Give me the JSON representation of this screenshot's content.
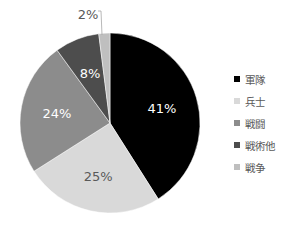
{
  "chart_data": {
    "type": "pie",
    "title": "",
    "categories": [
      "軍隊",
      "兵士",
      "戦闘",
      "戦術他",
      "戦争"
    ],
    "values": [
      41,
      25,
      24,
      8,
      2
    ],
    "labels": [
      "41%",
      "25%",
      "24%",
      "8%",
      "2%"
    ],
    "colors": [
      "#000000",
      "#d9d9d9",
      "#8c8c8c",
      "#4d4d4d",
      "#bfbfbf"
    ],
    "label_colors": [
      "#ffffff",
      "#595959",
      "#ffffff",
      "#ffffff",
      "#595959"
    ],
    "legend_position": "right",
    "start_angle_deg": 0,
    "direction": "clockwise"
  },
  "legend": {
    "items": [
      {
        "label": "軍隊",
        "color": "#000000"
      },
      {
        "label": "兵士",
        "color": "#d9d9d9"
      },
      {
        "label": "戦闘",
        "color": "#8c8c8c"
      },
      {
        "label": "戦術他",
        "color": "#4d4d4d"
      },
      {
        "label": "戦争",
        "color": "#bfbfbf"
      }
    ]
  }
}
